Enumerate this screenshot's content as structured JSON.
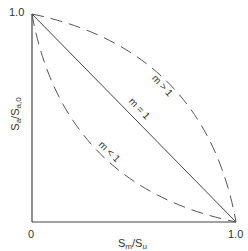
{
  "diagram": {
    "y_axis": {
      "label_main": "S",
      "label_sub1": "a",
      "label_sep": "/S",
      "label_sub2": "a,0",
      "tick_top": "1.0"
    },
    "x_axis": {
      "label_main": "S",
      "label_sub1": "m",
      "label_sep": "/S",
      "label_sub2": "u",
      "tick_origin": "0",
      "tick_end": "1.0"
    },
    "curves": [
      {
        "label": "m > 1",
        "style": "dashed",
        "shape": "concave"
      },
      {
        "label": "m = 1",
        "style": "solid",
        "shape": "linear"
      },
      {
        "label": "m < 1",
        "style": "dashed",
        "shape": "convex"
      }
    ],
    "colors": {
      "line": "#444444",
      "text": "#333333"
    }
  }
}
